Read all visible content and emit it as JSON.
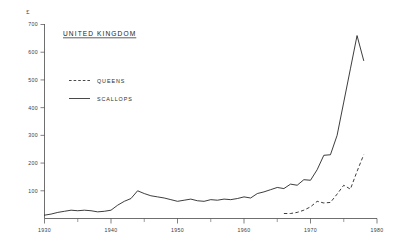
{
  "chart_data": {
    "type": "line",
    "title": "UNITED KINGDOM",
    "ylabel": "£",
    "xlabel": "",
    "xlim": [
      1930,
      1980
    ],
    "ylim": [
      0,
      700
    ],
    "grid": false,
    "legend_position": "upper-left-inset",
    "x_ticks_major": [
      1930,
      1940,
      1950,
      1960,
      1970,
      1980
    ],
    "x_ticks_minor": [
      1935,
      1945,
      1955,
      1965,
      1975
    ],
    "x_tick_labels": [
      "1930",
      "1940",
      "1950",
      "1960",
      "1970",
      "1980"
    ],
    "y_ticks": [
      100,
      200,
      300,
      400,
      500,
      600,
      700
    ],
    "y_tick_labels": [
      "100",
      "200",
      "300",
      "400",
      "500",
      "600",
      "700"
    ],
    "series": [
      {
        "name": "SCALLOPS",
        "style": "solid",
        "x": [
          1930,
          1931,
          1932,
          1933,
          1934,
          1935,
          1936,
          1937,
          1938,
          1939,
          1940,
          1941,
          1942,
          1943,
          1944,
          1945,
          1946,
          1947,
          1948,
          1949,
          1950,
          1951,
          1952,
          1953,
          1954,
          1955,
          1956,
          1957,
          1958,
          1959,
          1960,
          1961,
          1962,
          1963,
          1964,
          1965,
          1966,
          1967,
          1968,
          1969,
          1970,
          1971,
          1972,
          1973,
          1974,
          1975,
          1976,
          1977,
          1978
        ],
        "values": [
          12,
          16,
          22,
          26,
          30,
          28,
          30,
          28,
          24,
          26,
          30,
          48,
          62,
          72,
          100,
          90,
          82,
          78,
          74,
          68,
          62,
          66,
          70,
          64,
          62,
          68,
          66,
          70,
          68,
          72,
          78,
          74,
          90,
          96,
          104,
          112,
          108,
          124,
          120,
          140,
          138,
          176,
          228,
          230,
          300,
          420,
          540,
          660,
          570
        ]
      },
      {
        "name": "QUEENS",
        "style": "dashed",
        "x": [
          1966,
          1967,
          1968,
          1969,
          1970,
          1971,
          1972,
          1973,
          1974,
          1975,
          1976,
          1977,
          1978
        ],
        "values": [
          18,
          18,
          22,
          30,
          42,
          62,
          56,
          58,
          88,
          120,
          106,
          170,
          230
        ]
      }
    ]
  },
  "axes": {
    "y_axis_name": "y-axis",
    "x_axis_name": "x-axis"
  },
  "legend": {
    "entries": [
      {
        "label": "QUEENS",
        "style": "dashed"
      },
      {
        "label": "SCALLOPS",
        "style": "solid"
      }
    ]
  }
}
